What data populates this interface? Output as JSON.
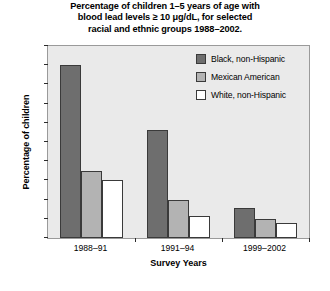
{
  "chart_data": {
    "type": "bar",
    "title": "Percentage of children 1–5 years of age with blood lead levels ≥ 10 μg/dL, for selected racial and ethnic groups 1988–2002.",
    "title_lines": [
      "Percentage of children 1–5 years of age with",
      "blood lead levels ≥ 10 μg/dL, for selected",
      "racial and ethnic groups 1988–2002."
    ],
    "xlabel": "Survey Years",
    "ylabel": "Percentage of children",
    "categories": [
      "1988–91",
      "1991–94",
      "1999–2002"
    ],
    "series": [
      {
        "name": "Black, non-Hispanic",
        "color": "#6e6e6e",
        "values": [
          18.0,
          11.2,
          3.1
        ]
      },
      {
        "name": "Mexican American",
        "color": "#b3b3b3",
        "values": [
          7.0,
          4.0,
          2.0
        ]
      },
      {
        "name": "White, non-Hispanic",
        "color": "#ffffff",
        "values": [
          6.0,
          2.3,
          1.6
        ]
      }
    ],
    "ylim": [
      0,
      20
    ],
    "ytick_step": 2,
    "yticks": [
      0,
      2,
      4,
      6,
      8,
      10,
      12,
      14,
      16,
      18,
      20
    ],
    "grid": false,
    "legend_position": "upper-right",
    "plot_background": "#eaeaea",
    "bar_edge_color": "#3a3a3a"
  }
}
